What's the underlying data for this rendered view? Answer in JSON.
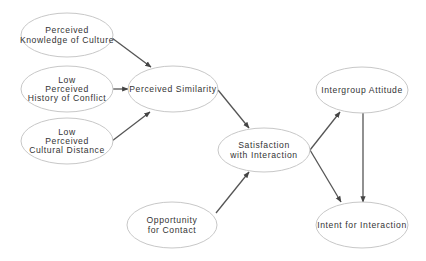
{
  "diagram": {
    "type": "path-model",
    "nodes": [
      {
        "id": "knowledge",
        "lines": [
          "Perceived",
          "Knowledge of Culture"
        ],
        "cx": 67,
        "cy": 35,
        "rx": 46,
        "ry": 22
      },
      {
        "id": "conflict",
        "lines": [
          "Low",
          "Perceived",
          "History of Conflict"
        ],
        "cx": 67,
        "cy": 89,
        "rx": 46,
        "ry": 23
      },
      {
        "id": "distance",
        "lines": [
          "Low",
          "Perceived",
          "Cultural Distance"
        ],
        "cx": 67,
        "cy": 141,
        "rx": 46,
        "ry": 23
      },
      {
        "id": "similarity",
        "lines": [
          "Perceived Similarity"
        ],
        "cx": 173,
        "cy": 89,
        "rx": 45,
        "ry": 23
      },
      {
        "id": "satisfaction",
        "lines": [
          "Satisfaction",
          "with Interaction"
        ],
        "cx": 264,
        "cy": 150,
        "rx": 46,
        "ry": 22
      },
      {
        "id": "opportunity",
        "lines": [
          "Opportunity",
          "for Contact"
        ],
        "cx": 172,
        "cy": 225,
        "rx": 45,
        "ry": 23
      },
      {
        "id": "attitude",
        "lines": [
          "Intergroup Attitude"
        ],
        "cx": 362,
        "cy": 90,
        "rx": 46,
        "ry": 23
      },
      {
        "id": "intent",
        "lines": [
          "Intent for Interaction"
        ],
        "cx": 362,
        "cy": 225,
        "rx": 46,
        "ry": 23
      }
    ],
    "edges": [
      {
        "from": "knowledge",
        "to": "similarity",
        "x1": 112,
        "y1": 38,
        "x2": 151,
        "y2": 67
      },
      {
        "from": "conflict",
        "to": "similarity",
        "x1": 113,
        "y1": 89,
        "x2": 128,
        "y2": 89
      },
      {
        "from": "distance",
        "to": "similarity",
        "x1": 112,
        "y1": 141,
        "x2": 150,
        "y2": 112
      },
      {
        "from": "similarity",
        "to": "satisfaction",
        "x1": 218,
        "y1": 90,
        "x2": 249,
        "y2": 128
      },
      {
        "from": "opportunity",
        "to": "satisfaction",
        "x1": 216,
        "y1": 213,
        "x2": 249,
        "y2": 172
      },
      {
        "from": "satisfaction",
        "to": "attitude",
        "x1": 310,
        "y1": 150,
        "x2": 340,
        "y2": 112
      },
      {
        "from": "satisfaction",
        "to": "intent",
        "x1": 310,
        "y1": 150,
        "x2": 341,
        "y2": 202
      },
      {
        "from": "attitude",
        "to": "intent",
        "x1": 363,
        "y1": 113,
        "x2": 363,
        "y2": 202
      }
    ]
  }
}
